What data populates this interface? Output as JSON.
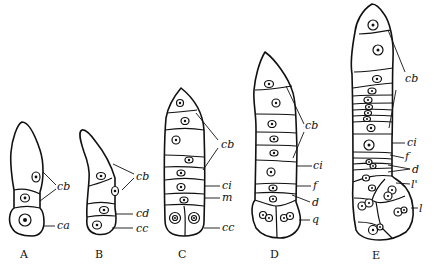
{
  "figure": {
    "stages": [
      {
        "id": "A",
        "caption": "A",
        "labels": [
          "cb",
          "ca"
        ]
      },
      {
        "id": "B",
        "caption": "B",
        "labels": [
          "cb",
          "cd",
          "cc"
        ]
      },
      {
        "id": "C",
        "caption": "C",
        "labels": [
          "cb",
          "ci",
          "m",
          "cc"
        ]
      },
      {
        "id": "D",
        "caption": "D",
        "labels": [
          "cb",
          "ci",
          "f",
          "d",
          "q"
        ]
      },
      {
        "id": "E",
        "caption": "E",
        "labels": [
          "cb",
          "ci",
          "f",
          "d",
          "l'",
          "l"
        ]
      }
    ]
  }
}
